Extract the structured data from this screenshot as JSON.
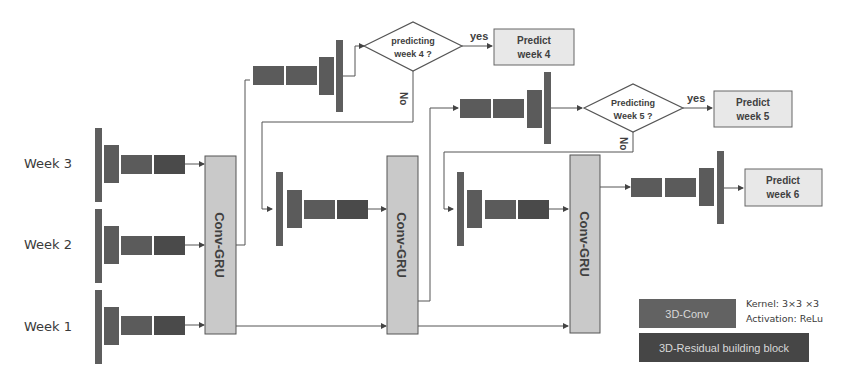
{
  "inputs": [
    {
      "label": "Week 3"
    },
    {
      "label": "Week 2"
    },
    {
      "label": "Week 1"
    }
  ],
  "gru_label": "Conv-GRU",
  "gru_blocks": [
    {
      "label": "Conv-GRU"
    },
    {
      "label": "Conv-GRU"
    },
    {
      "label": "Conv-GRU"
    }
  ],
  "decisions": [
    {
      "line1": "predicting",
      "line2": "week 4 ?",
      "yes": "yes",
      "no": "No"
    },
    {
      "line1": "Predicting",
      "line2": "Week 5 ?",
      "yes": "yes",
      "no": "No"
    }
  ],
  "outputs": [
    {
      "line1": "Predict",
      "line2": "week 4"
    },
    {
      "line1": "Predict",
      "line2": "week 5"
    },
    {
      "line1": "Predict",
      "line2": "week 6"
    }
  ],
  "legend": {
    "conv_label": "3D-Conv",
    "conv_kernel": "Kernel: 3×3 ×3",
    "conv_activation": "Activation: ReLu",
    "residual_label": "3D-Residual building block",
    "colors": {
      "conv": "#5e5e5e",
      "residual": "#444444"
    }
  }
}
